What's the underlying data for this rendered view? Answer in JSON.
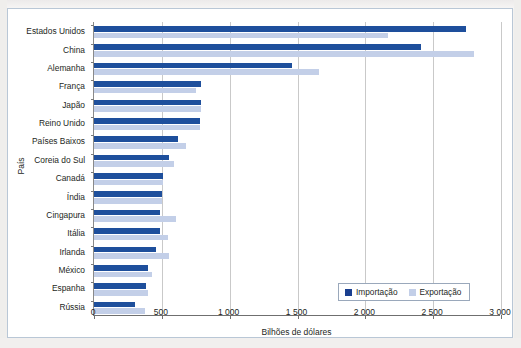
{
  "figure": {
    "title_cropped": "",
    "y_axis_title": "País",
    "x_axis_title": "Bilhões de dólares"
  },
  "legend": {
    "position": "bottom-right",
    "items": [
      {
        "label": "Importação",
        "color": "#1a3f8f"
      },
      {
        "label": "Exportação",
        "color": "#c3cfe8"
      }
    ]
  },
  "chart_data": {
    "type": "bar",
    "orientation": "horizontal",
    "title": "",
    "xlabel": "Bilhões de dólares",
    "ylabel": "País",
    "xlim": [
      0,
      3000
    ],
    "xticks": [
      0,
      500,
      1000,
      1500,
      2000,
      2500,
      3000
    ],
    "xticklabels": [
      "0",
      "500",
      "1 000",
      "1 500",
      "2 000",
      "2 500",
      "3 000"
    ],
    "grid": true,
    "categories": [
      "Estados Unidos",
      "China",
      "Alemanha",
      "França",
      "Japão",
      "Reino Unido",
      "Países Baixos",
      "Coreia do Sul",
      "Canadá",
      "Índia",
      "Cingapura",
      "Itália",
      "Irlanda",
      "México",
      "Espanha",
      "Rússia"
    ],
    "series": [
      {
        "name": "Importação",
        "color": "#1e4f9c",
        "values": [
          2740,
          2410,
          1460,
          790,
          790,
          780,
          620,
          555,
          505,
          500,
          485,
          485,
          460,
          400,
          380,
          305
        ]
      },
      {
        "name": "Exportação",
        "color": "#c3cfe8",
        "values": [
          2170,
          2800,
          1660,
          755,
          790,
          780,
          675,
          590,
          505,
          500,
          605,
          545,
          555,
          430,
          400,
          375
        ]
      }
    ]
  }
}
